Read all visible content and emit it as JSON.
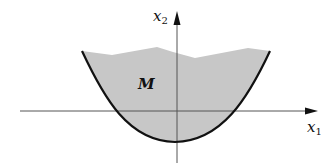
{
  "diagram": {
    "type": "set-region-plot",
    "region": {
      "label": "M",
      "fill_color": "#c7c7c7",
      "boundary_color": "#111111",
      "lower_boundary": "parabola",
      "upper_boundary": "jagged polyline"
    },
    "axes": {
      "x_axis": {
        "label_base": "x",
        "label_sub": "1"
      },
      "y_axis": {
        "label_base": "x",
        "label_sub": "2"
      },
      "color": "#555555"
    }
  }
}
